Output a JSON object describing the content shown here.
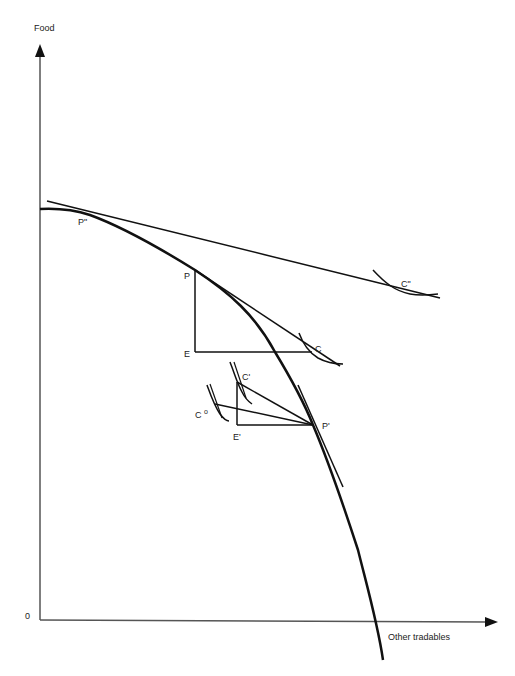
{
  "diagram": {
    "type": "production-possibility-frontier",
    "axes": {
      "y_label": "Food",
      "x_label": "Other tradables",
      "origin_label": "0"
    },
    "points": {
      "P_double_prime": "P\"",
      "P": "P",
      "E": "E",
      "C": "C",
      "C_double_prime": "C\"",
      "C_prime": "C'",
      "C_zero": "C",
      "C_zero_superscript": "o",
      "E_prime": "E'",
      "P_prime": "P'"
    },
    "colors": {
      "lines": "#111111",
      "axes": "#555555",
      "background": "#ffffff"
    }
  }
}
